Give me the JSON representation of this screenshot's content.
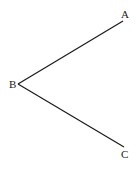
{
  "diagram": {
    "type": "angle",
    "stroke_color": "#1a1a1a",
    "points": {
      "A": {
        "label": "A",
        "x": 123,
        "y": 21
      },
      "B": {
        "label": "B",
        "x": 18,
        "y": 84
      },
      "C": {
        "label": "C",
        "x": 124,
        "y": 147
      }
    },
    "segments": [
      {
        "from": "B",
        "to": "A"
      },
      {
        "from": "B",
        "to": "C"
      }
    ]
  }
}
